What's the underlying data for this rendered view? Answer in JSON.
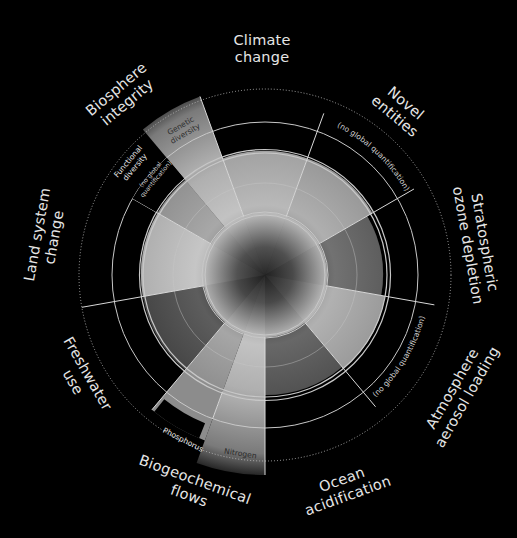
{
  "diagram": {
    "center": [
      265,
      275
    ],
    "rings": {
      "inner_radius": 62,
      "middle_radius": 92,
      "safe_boundary_radius": 124,
      "zone_of_uncertainty_radius": 153,
      "outer_dotted_radius": 186
    },
    "colors": {
      "background": "#000000",
      "ring_line": "#c8c8c8",
      "label_text": "#e6e6e6"
    },
    "boundaries": [
      {
        "id": "climate-change",
        "label_line1": "Climate",
        "label_line2": "change",
        "start_deg": 340,
        "end_deg": 20,
        "fill_radius": 124,
        "shade": "#a9a9a9"
      },
      {
        "id": "novel-entities",
        "label_line1": "Novel",
        "label_line2": "entities",
        "start_deg": 20,
        "end_deg": 60,
        "fill_radius": 124,
        "shade": "#9a9a9a",
        "note": "(no global quantification)"
      },
      {
        "id": "stratospheric-ozone-depletion",
        "label_line1": "Stratospheric",
        "label_line2": "ozone depletion",
        "start_deg": 60,
        "end_deg": 100,
        "fill_radius": 118,
        "shade": "#3c3c3c"
      },
      {
        "id": "atmosphere-aerosol-loading",
        "label_line1": "Atmosphere",
        "label_line2": "aerosol loading",
        "start_deg": 100,
        "end_deg": 140,
        "fill_radius": 122,
        "shade": "#9d9d9d",
        "note": "(no global quantification)"
      },
      {
        "id": "ocean-acidification",
        "label_line1": "Ocean",
        "label_line2": "acidification",
        "start_deg": 140,
        "end_deg": 180,
        "fill_radius": 120,
        "shade": "#2c2c2c"
      },
      {
        "id": "biogeochemical-flows",
        "label_line1": "Biogeochemical",
        "label_line2": "flows",
        "start_deg": 180,
        "end_deg": 220,
        "sub": [
          {
            "id": "nitrogen",
            "label": "Nitrogen",
            "start_deg": 180,
            "end_deg": 200,
            "fill_radius": 200,
            "shade": "#a0a0a0"
          },
          {
            "id": "phosphorus",
            "label": "Phosphorus",
            "start_deg": 200,
            "end_deg": 220,
            "fill_radius": 176,
            "shade": "#8c8c8c"
          }
        ]
      },
      {
        "id": "freshwater-use",
        "label_line1": "Freshwater",
        "label_line2": "use",
        "start_deg": 220,
        "end_deg": 260,
        "fill_radius": 124,
        "shade": "#1c1c1c"
      },
      {
        "id": "land-system-change",
        "label_line1": "Land system",
        "label_line2": "change",
        "start_deg": 260,
        "end_deg": 300,
        "fill_radius": 124,
        "shade": "#bdbdbd"
      },
      {
        "id": "biosphere-integrity",
        "label_line1": "Biosphere",
        "label_line2": "integrity",
        "start_deg": 300,
        "end_deg": 340,
        "sub": [
          {
            "id": "functional-diversity",
            "label_line1": "Functional",
            "label_line2": "diversity",
            "note_line1": "(no global",
            "note_line2": "quantification)",
            "start_deg": 300,
            "end_deg": 320,
            "fill_radius": 124,
            "shade": "#8f8f8f"
          },
          {
            "id": "genetic-diversity",
            "label_line1": "Genetic",
            "label_line2": "diversity",
            "start_deg": 320,
            "end_deg": 340,
            "fill_radius": 190,
            "shade": "#6e6e6e"
          }
        ]
      }
    ]
  }
}
